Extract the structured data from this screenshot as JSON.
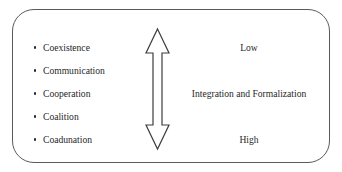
{
  "diagram": {
    "frame": {
      "shape": "rounded-rectangle",
      "border_color": "#5a5a5a",
      "background_color": "#ffffff"
    },
    "bullet_list": {
      "items": [
        {
          "label": "Coexistence"
        },
        {
          "label": "Communication"
        },
        {
          "label": "Cooperation"
        },
        {
          "label": "Coalition"
        },
        {
          "label": "Coadunation"
        }
      ]
    },
    "arrow": {
      "icon": "double-headed-vertical-arrow-icon",
      "fill_color": "#ffffff",
      "stroke_color": "#3d3d3d"
    },
    "scale": {
      "top_label": "Low",
      "middle_label": "Integration and Formalization",
      "bottom_label": "High"
    }
  }
}
